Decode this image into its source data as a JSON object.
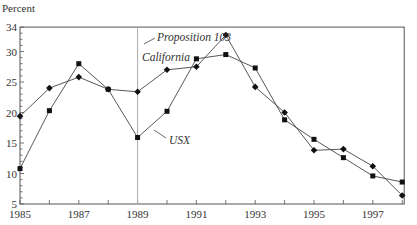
{
  "chart_data": {
    "type": "line",
    "title": "",
    "xlabel": "",
    "ylabel": "Percent",
    "xlim": [
      1985,
      1998
    ],
    "ylim": [
      5,
      34
    ],
    "x_ticks": [
      1985,
      1987,
      1989,
      1991,
      1993,
      1995,
      1997
    ],
    "x_minor_ticks": [
      1986,
      1988,
      1990,
      1992,
      1994,
      1996,
      1998
    ],
    "y_ticks": [
      5,
      10,
      15,
      20,
      25,
      30,
      34
    ],
    "grid": false,
    "x": [
      1985,
      1986,
      1987,
      1988,
      1989,
      1990,
      1991,
      1992,
      1993,
      1994,
      1995,
      1996,
      1997,
      1998
    ],
    "series": [
      {
        "name": "California",
        "marker": "diamond",
        "values": [
          19.4,
          24.0,
          25.8,
          23.8,
          23.4,
          27.0,
          27.5,
          32.7,
          24.2,
          20.0,
          13.8,
          14.0,
          11.2,
          6.4
        ]
      },
      {
        "name": "USX",
        "marker": "square",
        "values": [
          10.8,
          20.3,
          28.0,
          23.8,
          15.9,
          20.2,
          28.8,
          29.5,
          27.3,
          18.8,
          15.6,
          12.6,
          9.6,
          8.6
        ]
      }
    ],
    "annotations": [
      {
        "text": "Proposition 103",
        "type": "vertical-line",
        "x": 1989
      },
      {
        "text": "California",
        "type": "series-label"
      },
      {
        "text": "USX",
        "type": "series-label"
      }
    ],
    "legend": "none (inline labels)"
  },
  "labels": {
    "ylabel": "Percent",
    "proposition": "Proposition 103",
    "california": "California",
    "usx": "USX"
  }
}
